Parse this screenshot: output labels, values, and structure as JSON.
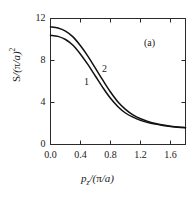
{
  "chart_data": {
    "type": "line",
    "title": "",
    "panel_label": "(a)",
    "xlabel": "p_z/(pi/a)",
    "ylabel": "S/(pi/a)^2",
    "xlim": [
      0.0,
      1.8
    ],
    "ylim": [
      0,
      12
    ],
    "grid": false,
    "legend": "inline curve labels",
    "xticks": [
      "0.0",
      "0.4",
      "0.8",
      "1.2",
      "1.6"
    ],
    "xtick_values": [
      0.0,
      0.4,
      0.8,
      1.2,
      1.6
    ],
    "yticks": [
      "0",
      "4",
      "8",
      "12"
    ],
    "ytick_values": [
      0,
      4,
      8,
      12
    ],
    "x": [
      0.0,
      0.1,
      0.2,
      0.3,
      0.4,
      0.5,
      0.6,
      0.7,
      0.8,
      0.9,
      1.0,
      1.1,
      1.2,
      1.3,
      1.4,
      1.5,
      1.6,
      1.7,
      1.8
    ],
    "series": [
      {
        "name": "1",
        "label": "1",
        "color": "#111111",
        "values": [
          10.4,
          10.3,
          10.0,
          9.45,
          8.6,
          7.6,
          6.5,
          5.4,
          4.4,
          3.6,
          3.0,
          2.6,
          2.3,
          2.1,
          1.95,
          1.82,
          1.72,
          1.65,
          1.6
        ]
      },
      {
        "name": "2",
        "label": "2",
        "color": "#111111",
        "values": [
          11.2,
          11.1,
          10.8,
          10.25,
          9.4,
          8.4,
          7.25,
          6.1,
          5.0,
          4.05,
          3.35,
          2.82,
          2.45,
          2.2,
          2.0,
          1.86,
          1.75,
          1.66,
          1.6
        ]
      }
    ],
    "annotations": [
      {
        "text": "1",
        "x": 0.5,
        "y": 5.85
      },
      {
        "text": "2",
        "x": 0.74,
        "y": 7.05
      },
      {
        "text": "(a)",
        "x": 1.3,
        "y": 9.55
      }
    ],
    "axis_color": "#2a2a2a",
    "background": "#ffffff"
  }
}
